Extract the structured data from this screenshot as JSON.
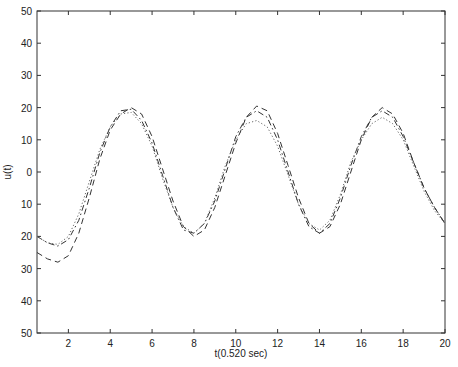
{
  "chart_data": {
    "type": "line",
    "title": "",
    "xlabel": "t(0.520 sec)",
    "ylabel": "u(t)",
    "xlim": [
      0.5,
      20
    ],
    "ylim": [
      -50,
      50
    ],
    "grid": false,
    "legend": null,
    "xticks": [
      2,
      4,
      6,
      8,
      10,
      12,
      14,
      16,
      18,
      20
    ],
    "xtick_labels": [
      "2",
      "4",
      "6",
      "8",
      "10",
      "12",
      "14",
      "16",
      "18",
      "20"
    ],
    "yticks": [
      50,
      40,
      30,
      20,
      10,
      0,
      -10,
      -20,
      -30,
      -40,
      -50
    ],
    "ytick_labels": [
      "50",
      "40",
      "30",
      "20",
      "10",
      "0",
      "10",
      "20",
      "30",
      "40",
      "50"
    ],
    "series": [
      {
        "name": "dashed",
        "style": "dashed",
        "x": [
          0.5,
          1.0,
          1.5,
          2.0,
          2.5,
          3.0,
          3.5,
          4.0,
          4.5,
          5.0,
          5.5,
          6.0,
          6.5,
          7.0,
          7.5,
          8.0,
          8.5,
          9.0,
          9.5,
          10.0,
          10.5,
          11.0,
          11.5,
          12.0,
          12.5,
          13.0,
          13.5,
          14.0,
          14.5,
          15.0,
          15.5,
          16.0,
          16.5,
          17.0,
          17.5,
          18.0,
          18.5,
          19.0,
          19.5,
          20.0
        ],
        "y": [
          -25,
          -27,
          -28,
          -26,
          -19,
          -8,
          4,
          13,
          18,
          20,
          18,
          11,
          1,
          -9,
          -17,
          -20,
          -18,
          -11,
          -1,
          9,
          17,
          20.5,
          19,
          12,
          2,
          -8,
          -16,
          -19,
          -17,
          -10,
          0,
          10,
          17,
          20,
          18,
          12,
          3,
          -5,
          -11,
          -16
        ]
      },
      {
        "name": "dash-dot",
        "style": "dashdot",
        "x": [
          0.5,
          1.0,
          1.5,
          2.0,
          2.5,
          3.0,
          3.5,
          4.0,
          4.5,
          5.0,
          5.5,
          6.0,
          6.5,
          7.0,
          7.5,
          8.0,
          8.5,
          9.0,
          9.5,
          10.0,
          10.5,
          11.0,
          11.5,
          12.0,
          12.5,
          13.0,
          13.5,
          14.0,
          14.5,
          15.0,
          15.5,
          16.0,
          16.5,
          17.0,
          17.5,
          18.0,
          18.5,
          19.0,
          19.5,
          20.0
        ],
        "y": [
          -20,
          -22,
          -23,
          -21,
          -15,
          -5,
          6,
          14,
          19,
          19.5,
          16,
          9,
          -1,
          -11,
          -18,
          -19,
          -16,
          -9,
          1,
          11,
          17,
          19,
          17,
          10,
          0,
          -10,
          -17,
          -19,
          -16,
          -8,
          2,
          11,
          17,
          19,
          17,
          11,
          3,
          -5,
          -11,
          -16
        ]
      },
      {
        "name": "dotted",
        "style": "dotted",
        "x": [
          0.5,
          1.0,
          1.5,
          2.0,
          2.5,
          3.0,
          3.5,
          4.0,
          4.5,
          5.0,
          5.5,
          6.0,
          6.5,
          7.0,
          7.5,
          8.0,
          8.5,
          9.0,
          9.5,
          10.0,
          10.5,
          11.0,
          11.5,
          12.0,
          12.5,
          13.0,
          13.5,
          14.0,
          14.5,
          15.0,
          15.5,
          16.0,
          16.5,
          17.0,
          17.5,
          18.0,
          18.5,
          19.0,
          19.5,
          20.0
        ],
        "y": [
          -20,
          -22,
          -22.5,
          -20,
          -13,
          -3,
          7,
          14,
          18,
          18.5,
          15,
          8,
          -2,
          -11,
          -17,
          -19,
          -16,
          -8,
          2,
          10,
          15,
          16,
          14,
          8,
          -1,
          -10,
          -16,
          -18,
          -15,
          -7,
          3,
          10,
          15,
          17,
          15,
          10,
          2,
          -6,
          -12,
          -16
        ]
      }
    ]
  }
}
